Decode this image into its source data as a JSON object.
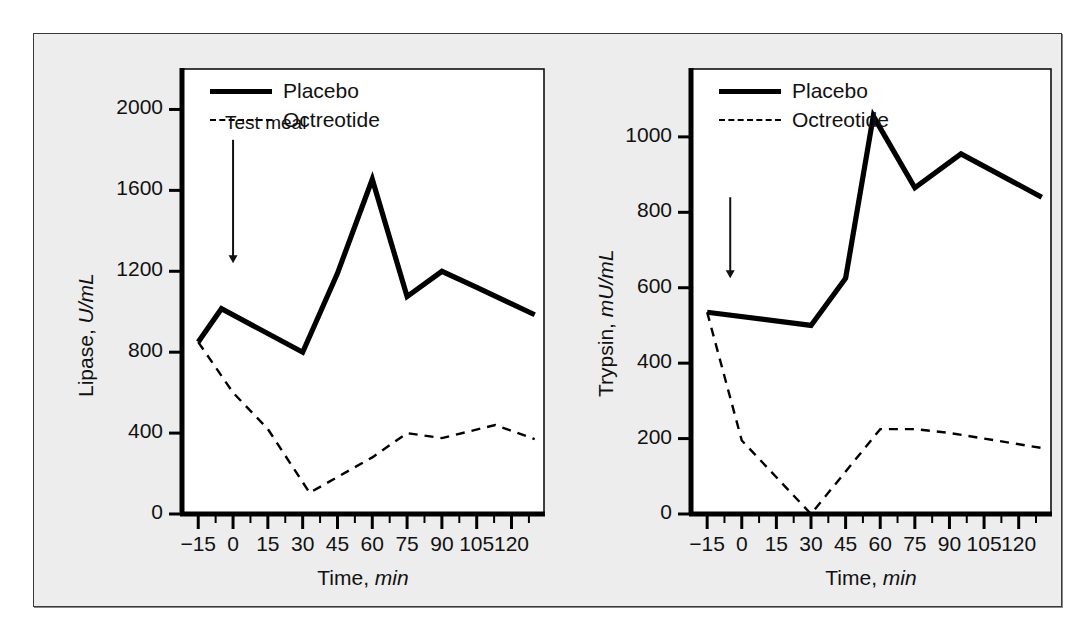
{
  "figure": {
    "background": "#ededed",
    "line_color": "#000000"
  },
  "chart_data": [
    {
      "type": "line",
      "id": "lipase",
      "title": "",
      "xlabel": "Time, min",
      "xlabel_plain": "Time,",
      "xlabel_unit": "min",
      "ylabel": "Lipase, U/mL",
      "ylabel_plain": "Lipase,",
      "ylabel_unit": "U/mL",
      "xlim": [
        -22,
        134
      ],
      "ylim": [
        0,
        2200
      ],
      "xticks": [
        -15,
        0,
        15,
        30,
        45,
        60,
        75,
        90,
        105,
        120
      ],
      "xticklabels": [
        "−15",
        "0",
        "15",
        "30",
        "45",
        "60",
        "75",
        "90",
        "105",
        "120"
      ],
      "yticks": [
        0,
        400,
        800,
        1200,
        1600,
        2000
      ],
      "yticklabels": [
        "0",
        "400",
        "800",
        "1200",
        "1600",
        "2000"
      ],
      "grid": false,
      "legend_position": "top-left",
      "annotation": {
        "text": "Test meal",
        "arrow_x": 0,
        "arrow_y_from": 1850,
        "arrow_y_to": 1240
      },
      "series": [
        {
          "name": "Placebo",
          "style": "solid",
          "x": [
            -15,
            -5,
            30,
            45,
            60,
            75,
            90,
            105,
            130
          ],
          "values": [
            850,
            1015,
            800,
            1190,
            1655,
            1075,
            1200,
            1120,
            985
          ]
        },
        {
          "name": "Octreotide",
          "style": "dashed",
          "x": [
            -15,
            0,
            15,
            33,
            60,
            75,
            90,
            113,
            130
          ],
          "values": [
            850,
            600,
            420,
            105,
            280,
            400,
            375,
            440,
            370
          ]
        }
      ]
    },
    {
      "type": "line",
      "id": "trypsin",
      "title": "",
      "xlabel": "Time, min",
      "xlabel_plain": "Time,",
      "xlabel_unit": "min",
      "ylabel": "Trypsin, mU/mL",
      "ylabel_plain": "Trypsin,",
      "ylabel_unit": "mU/mL",
      "xlim": [
        -22,
        134
      ],
      "ylim": [
        0,
        1180
      ],
      "xticks": [
        -15,
        0,
        15,
        30,
        45,
        60,
        75,
        90,
        105,
        120
      ],
      "xticklabels": [
        "−15",
        "0",
        "15",
        "30",
        "45",
        "60",
        "75",
        "90",
        "105",
        "120"
      ],
      "yticks": [
        0,
        200,
        400,
        600,
        800,
        1000
      ],
      "yticklabels": [
        "0",
        "200",
        "400",
        "600",
        "800",
        "1000"
      ],
      "grid": false,
      "legend_position": "top-left",
      "annotation": {
        "text": "",
        "arrow_x": -5,
        "arrow_y_from": 840,
        "arrow_y_to": 625
      },
      "series": [
        {
          "name": "Placebo",
          "style": "solid",
          "x": [
            -15,
            30,
            45,
            57,
            75,
            95,
            130
          ],
          "values": [
            535,
            500,
            625,
            1055,
            865,
            955,
            840
          ]
        },
        {
          "name": "Octreotide",
          "style": "dashed",
          "x": [
            -15,
            0,
            30,
            60,
            75,
            90,
            130
          ],
          "values": [
            535,
            195,
            0,
            225,
            225,
            215,
            175
          ]
        }
      ]
    }
  ],
  "legend": {
    "placebo": "Placebo",
    "octreotide": "Octreotide"
  }
}
